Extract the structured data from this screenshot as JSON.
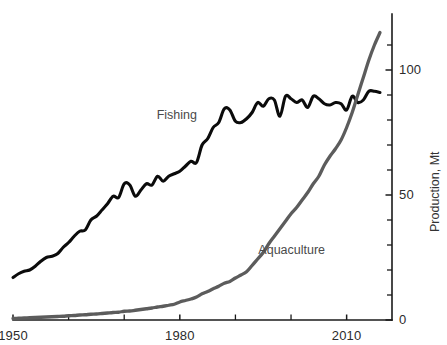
{
  "chart_data": {
    "type": "line",
    "title": "",
    "subtitle": "",
    "xlabel": "",
    "ylabel": "Production, Mt",
    "xlim": [
      1950,
      2016
    ],
    "ylim": [
      0,
      118
    ],
    "x_ticks_major": [
      1950,
      1980,
      2010
    ],
    "x_tick_labels": [
      "1950",
      "1980",
      "2010"
    ],
    "x_ticks_minor": [
      1960,
      1970,
      1990,
      2000
    ],
    "y_ticks_major": [
      0,
      50,
      100
    ],
    "y_tick_labels": [
      "0",
      "50",
      "100"
    ],
    "y_ticks_minor": [
      10,
      20,
      30,
      40,
      60,
      70,
      80,
      90,
      110
    ],
    "grid": false,
    "legend_position": "inline-annotation",
    "axis_side_y": "right",
    "x": [
      1950,
      1951,
      1952,
      1953,
      1954,
      1955,
      1956,
      1957,
      1958,
      1959,
      1960,
      1961,
      1962,
      1963,
      1964,
      1965,
      1966,
      1967,
      1968,
      1969,
      1970,
      1971,
      1972,
      1973,
      1974,
      1975,
      1976,
      1977,
      1978,
      1979,
      1980,
      1981,
      1982,
      1983,
      1984,
      1985,
      1986,
      1987,
      1988,
      1989,
      1990,
      1991,
      1992,
      1993,
      1994,
      1995,
      1996,
      1997,
      1998,
      1999,
      2000,
      2001,
      2002,
      2003,
      2004,
      2005,
      2006,
      2007,
      2008,
      2009,
      2010,
      2011,
      2012,
      2013,
      2014,
      2015,
      2016
    ],
    "series": [
      {
        "name": "Fishing",
        "color": "#0b0b0b",
        "label_x": 1978,
        "label_y": 82,
        "values": [
          17.0,
          18.5,
          19.5,
          20.0,
          21.5,
          23.5,
          25.0,
          25.5,
          26.5,
          29.0,
          31.0,
          33.5,
          35.5,
          36.0,
          40.0,
          41.5,
          44.0,
          46.5,
          49.5,
          49.0,
          54.5,
          54.0,
          49.5,
          52.0,
          54.5,
          54.0,
          57.5,
          55.5,
          57.5,
          58.5,
          59.5,
          61.5,
          63.5,
          63.0,
          70.0,
          72.5,
          77.0,
          79.0,
          84.5,
          84.0,
          79.5,
          79.0,
          80.5,
          83.0,
          87.0,
          85.5,
          88.5,
          88.0,
          81.5,
          89.5,
          88.5,
          87.0,
          88.0,
          85.0,
          89.5,
          88.5,
          86.5,
          86.0,
          87.0,
          86.5,
          84.0,
          89.5,
          87.0,
          88.0,
          91.5,
          91.5,
          91.0
        ]
      },
      {
        "name": "Aquaculture",
        "color": "#5c5c5c",
        "label_x": 1997,
        "label_y": 28,
        "values": [
          0.6,
          0.7,
          0.8,
          0.9,
          1.0,
          1.1,
          1.2,
          1.3,
          1.4,
          1.5,
          1.7,
          1.8,
          2.0,
          2.1,
          2.3,
          2.4,
          2.6,
          2.8,
          3.0,
          3.1,
          3.5,
          3.6,
          3.9,
          4.2,
          4.5,
          4.8,
          5.2,
          5.5,
          5.9,
          6.3,
          7.2,
          7.8,
          8.4,
          9.2,
          10.5,
          11.4,
          12.5,
          13.5,
          14.7,
          15.4,
          16.8,
          18.0,
          19.3,
          21.8,
          24.4,
          27.0,
          30.5,
          33.5,
          36.5,
          39.5,
          42.5,
          45.0,
          48.0,
          51.0,
          54.5,
          57.5,
          62.0,
          65.5,
          68.5,
          72.0,
          77.0,
          83.0,
          90.0,
          97.0,
          104.0,
          110.0,
          115.0
        ]
      }
    ]
  },
  "axes": {
    "y_axis_title": "Production, Mt"
  },
  "labels": {
    "fishing": "Fishing",
    "aquaculture": "Aquaculture"
  }
}
